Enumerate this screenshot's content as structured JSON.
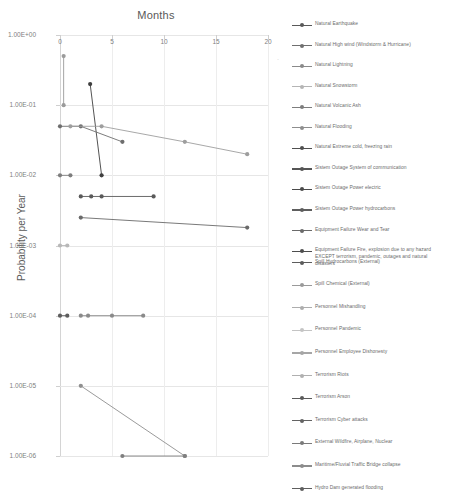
{
  "chart": {
    "title": "Months",
    "ylabel": "Probability per Year",
    "xlabel": "Months"
  },
  "axes": {
    "x_ticks": [
      "0",
      "5",
      "10",
      "15",
      "20"
    ],
    "y_ticks": [
      "1.00E+00",
      "1.00E-01",
      "1.00E-02",
      "1.00E-03",
      "1.00E-04",
      "1.00E-05",
      "1.00E-06"
    ]
  },
  "legend": {
    "items": [
      {
        "label": "Natural Earthquake",
        "color": "#595959"
      },
      {
        "label": "Natural High wind (Windstorm & Hurricane)",
        "color": "#6f6f6f"
      },
      {
        "label": "Natural Lightning",
        "color": "#8a8a8a"
      },
      {
        "label": "Natural Snowstorm",
        "color": "#b5b5b5"
      },
      {
        "label": "Natural Volcanic Ash",
        "color": "#7d7d7d"
      },
      {
        "label": "Natural Flooding",
        "color": "#8e8e8e"
      },
      {
        "label": "Natural Extreme cold, freezing rain",
        "color": "#4f4f4f"
      },
      {
        "label": "Sistem Outage System of communication",
        "color": "#555555"
      },
      {
        "label": "Sistem Outage Power electric",
        "color": "#4a4a4a"
      },
      {
        "label": "Sistem Outage Power hydrocarbons",
        "color": "#5e5e5e"
      },
      {
        "label": "Equipment Failure Wear and Tear",
        "color": "#6a6a6a"
      },
      {
        "label": "Equipment Failure Fire, explosion due to any hazard\nEXCEPT terrorism, pandemic, outages and natural\ndisasters",
        "color": "#4d4d4d"
      },
      {
        "label": "Spill Hydrocarbons (External)",
        "color": "#5c5c5c"
      },
      {
        "label": "Spill Chemical (External)",
        "color": "#9a9a9a"
      },
      {
        "label": "Personnel Mishandling",
        "color": "#adadad"
      },
      {
        "label": "Personnel Pandemic",
        "color": "#c4c4c4"
      },
      {
        "label": "Personnel Employee Dishonesty",
        "color": "#a6a6a6"
      },
      {
        "label": "Terrorism Riots",
        "color": "#b0b0b0"
      },
      {
        "label": "Terrorism Arson",
        "color": "#5a5a5a"
      },
      {
        "label": "Terrorism Cyber attacks",
        "color": "#636363"
      },
      {
        "label": "External Wildfire, Airplane, Nuclear",
        "color": "#7a7a7a"
      },
      {
        "label": "Maritime/Fluvial Traffic Bridge collapse",
        "color": "#8c8c8c"
      },
      {
        "label": "Hydro Dam generated flooding",
        "color": "#5f5f5f"
      }
    ]
  },
  "chart_data": {
    "type": "line",
    "title": "Months",
    "xlabel": "Months",
    "ylabel": "Probability per Year",
    "x_scale": "linear",
    "y_scale": "log",
    "xlim": [
      0,
      20
    ],
    "ylim": [
      1e-06,
      1
    ],
    "grid": true,
    "legend_position": "right",
    "x_axis_position": "top",
    "series": [
      {
        "name": "Natural Earthquake",
        "color": "#9b9b9b",
        "points": [
          {
            "x": 0.35,
            "y": 0.5
          },
          {
            "x": 0.35,
            "y": 0.1
          }
        ]
      },
      {
        "name": "Natural High wind (Windstorm & Hurricane)",
        "color": "#3f3f3f",
        "points": [
          {
            "x": 2.9,
            "y": 0.2
          },
          {
            "x": 4.0,
            "y": 0.01
          }
        ]
      },
      {
        "name": "Natural Lightning",
        "color": "#6e6e6e",
        "points": [
          {
            "x": 0.0,
            "y": 0.05
          },
          {
            "x": 2.0,
            "y": 0.05
          },
          {
            "x": 6.0,
            "y": 0.03
          }
        ]
      },
      {
        "name": "Natural Snowstorm",
        "color": "#9e9e9e",
        "points": [
          {
            "x": 1.0,
            "y": 0.05
          },
          {
            "x": 4.0,
            "y": 0.05
          },
          {
            "x": 12.0,
            "y": 0.03
          },
          {
            "x": 18.0,
            "y": 0.02
          }
        ]
      },
      {
        "name": "Natural Volcanic Ash",
        "color": "#7d7d7d",
        "points": [
          {
            "x": 0.0,
            "y": 0.01
          },
          {
            "x": 1.0,
            "y": 0.01
          }
        ]
      },
      {
        "name": "Natural Flooding",
        "color": "#5a5a5a",
        "points": [
          {
            "x": 2.0,
            "y": 0.005
          },
          {
            "x": 3.0,
            "y": 0.005
          },
          {
            "x": 4.0,
            "y": 0.005
          },
          {
            "x": 9.0,
            "y": 0.005
          }
        ]
      },
      {
        "name": "Natural Extreme cold, freezing rain",
        "color": "#6a6a6a",
        "points": [
          {
            "x": 2.0,
            "y": 0.0025
          },
          {
            "x": 18.0,
            "y": 0.0018
          }
        ]
      },
      {
        "name": "Sistem Outage System of communication",
        "color": "#b8b8b8",
        "points": [
          {
            "x": 0.0,
            "y": 0.001
          },
          {
            "x": 0.7,
            "y": 0.001
          }
        ]
      },
      {
        "name": "Sistem Outage Power electric",
        "color": "#5d5d5d",
        "points": [
          {
            "x": 0.0,
            "y": 0.0001
          },
          {
            "x": 0.7,
            "y": 0.0001
          }
        ]
      },
      {
        "name": "Sistem Outage Power hydrocarbons",
        "color": "#8a8a8a",
        "points": [
          {
            "x": 2.0,
            "y": 0.0001
          },
          {
            "x": 2.7,
            "y": 0.0001
          },
          {
            "x": 5.0,
            "y": 0.0001
          },
          {
            "x": 8.0,
            "y": 0.0001
          }
        ]
      },
      {
        "name": "Terrorism Cyber attacks",
        "color": "#8f8f8f",
        "points": [
          {
            "x": 2.0,
            "y": 1e-05
          },
          {
            "x": 12.0,
            "y": 1e-06
          }
        ]
      },
      {
        "name": "Hydro Dam generated flooding",
        "color": "#7f7f7f",
        "points": [
          {
            "x": 6.0,
            "y": 1e-06
          },
          {
            "x": 12.0,
            "y": 1e-06
          }
        ]
      }
    ]
  }
}
